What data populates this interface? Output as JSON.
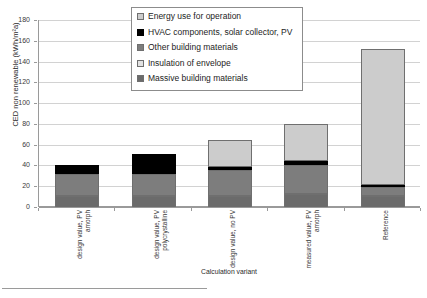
{
  "chart_data": {
    "type": "bar",
    "subtype": "stacked-column",
    "title": "",
    "xlabel": "Calculation variant",
    "ylabel": "CED non renewable (kWh/m²a)",
    "ylim": [
      0,
      180
    ],
    "ytick_step": 20,
    "yticks": [
      180,
      160,
      140,
      120,
      100,
      80,
      60,
      40,
      20,
      0
    ],
    "grid": true,
    "legend_position": "inside-top-center",
    "categories": [
      "design value, PV\namorph",
      "design value, PV\npolycrystalline",
      "design value, no PV",
      "measured value, PV\namorph",
      "Reference"
    ],
    "series": [
      {
        "name": "Massive building materials",
        "color": "#6b6b6b",
        "values": [
          10.5,
          10.5,
          10.5,
          12.5,
          11.0
        ]
      },
      {
        "name": "Insulation of envelope",
        "color": "#e2e2e2",
        "values": [
          2.0,
          2.0,
          2.0,
          2.0,
          2.0
        ]
      },
      {
        "name": "Other building materials",
        "color": "#7d7d7d",
        "values": [
          21.5,
          21.5,
          25.0,
          28.0,
          8.0
        ]
      },
      {
        "name": "HVAC components, solar collector, PV",
        "color": "#000000",
        "values": [
          8.0,
          19.0,
          4.0,
          5.0,
          3.0
        ]
      },
      {
        "name": "Energy use for operation",
        "color": "#cccccc",
        "values": [
          0.0,
          0.0,
          25.5,
          35.5,
          131.0
        ]
      }
    ],
    "totals": [
      42,
      53,
      67,
      83,
      155
    ],
    "legend_entries": [
      {
        "label": "Energy use for operation",
        "color": "#cccccc"
      },
      {
        "label": "HVAC components, solar collector, PV",
        "color": "#000000"
      },
      {
        "label": "Other building materials",
        "color": "#7d7d7d"
      },
      {
        "label": "Insulation of envelope",
        "color": "#e2e2e2"
      },
      {
        "label": "Massive building materials",
        "color": "#6b6b6b"
      }
    ]
  }
}
